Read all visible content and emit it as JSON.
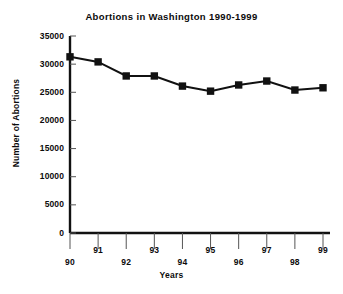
{
  "chart_data": {
    "type": "line",
    "title": "Abortions in Washington 1990-1999",
    "xlabel": "Years",
    "ylabel": "Number of Abortions",
    "categories": [
      "90",
      "91",
      "92",
      "93",
      "94",
      "95",
      "96",
      "97",
      "98",
      "99"
    ],
    "x": [
      1990,
      1991,
      1992,
      1993,
      1994,
      1995,
      1996,
      1997,
      1998,
      1999
    ],
    "values": [
      31300,
      30400,
      27900,
      27900,
      26100,
      25200,
      26300,
      27000,
      25400,
      25800
    ],
    "ylim": [
      0,
      35000
    ],
    "yticks": [
      0,
      5000,
      10000,
      15000,
      20000,
      25000,
      30000,
      35000
    ],
    "ytick_labels": [
      "0",
      "5000",
      "10000",
      "15000",
      "20000",
      "25000",
      "30000",
      "35000"
    ],
    "xtick_labels": [
      "90",
      "91",
      "92",
      "93",
      "94",
      "95",
      "96",
      "97",
      "98",
      "99"
    ],
    "grid": false,
    "legend": "none",
    "series_color": "#111111",
    "marker": "square",
    "axis_color": "#111111"
  }
}
